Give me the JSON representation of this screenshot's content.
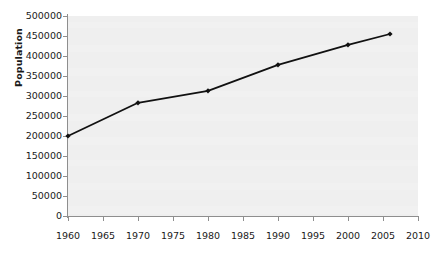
{
  "chart_data": {
    "type": "line",
    "title": "",
    "subtitle": "",
    "xlabel": "",
    "ylabel": "Population",
    "xlim": [
      1960,
      2010
    ],
    "ylim": [
      0,
      500000
    ],
    "grid": false,
    "legend": "none",
    "x": [
      1960,
      1970,
      1980,
      1990,
      2000,
      2006
    ],
    "values": [
      200000,
      283000,
      313000,
      378000,
      428000,
      455000
    ],
    "series": [
      {
        "name": "Population",
        "x": [
          1960,
          1970,
          1980,
          1990,
          2000,
          2006
        ],
        "values": [
          200000,
          283000,
          313000,
          378000,
          428000,
          455000
        ],
        "color": "#111111",
        "marker": "diamond"
      }
    ],
    "yticks": [
      0,
      50000,
      100000,
      150000,
      200000,
      250000,
      300000,
      350000,
      400000,
      450000,
      500000
    ],
    "ytick_labels": [
      "0",
      "50000",
      "100000",
      "150000",
      "200000",
      "250000",
      "300000",
      "350000",
      "400000",
      "450000",
      "500000"
    ],
    "xticks": [
      1960,
      1965,
      1970,
      1975,
      1980,
      1985,
      1990,
      1995,
      2000,
      2005,
      2010
    ],
    "xtick_labels": [
      "1960",
      "1965",
      "1970",
      "1975",
      "1980",
      "1985",
      "1990",
      "1995",
      "2000",
      "2005",
      "2010"
    ],
    "colors": {
      "line": "#111111",
      "plot_background": "#efefef",
      "figure_background": "#ffffff",
      "axis": "#8e8e8e",
      "text": "#1a1a1a"
    }
  }
}
